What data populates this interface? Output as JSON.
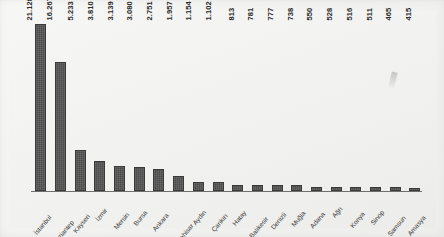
{
  "chart_data": {
    "type": "bar",
    "title": "",
    "subtitle": "",
    "xlabel": "",
    "ylabel": "",
    "grid": false,
    "legend": "none",
    "ylim": [
      0,
      21128
    ],
    "categories": [
      "İstanbul",
      "Gaziantep",
      "Kayseri",
      "İzmir",
      "Mersin",
      "Bursa",
      "Ankara",
      "A.Karahisar",
      "Aydın",
      "Çankırı",
      "Hatay",
      "Balıkesir",
      "Denizli",
      "Muğla",
      "Adana",
      "Ağrı",
      "Konya",
      "Sinop",
      "Samsun",
      "Amasya"
    ],
    "values": [
      21128,
      16267,
      5233,
      3810,
      3139,
      3080,
      2751,
      1957,
      1154,
      1102,
      813,
      781,
      777,
      738,
      550,
      528,
      516,
      511,
      465,
      415
    ],
    "value_labels": [
      "21.128",
      "16.267",
      "5.233",
      "3.810",
      "3.139",
      "3.080",
      "2.751",
      "1.957",
      "1.154",
      "1.102",
      "813",
      "781",
      "777",
      "738",
      "550",
      "528",
      "516",
      "511",
      "465",
      "415"
    ]
  },
  "style": {
    "bar_color": "#4a4a4a",
    "axis_color": "#6f6f6f",
    "panel_color": "#f2f2f0",
    "page_color": "#f6f6f4",
    "label_color": "#3a3a3a"
  }
}
